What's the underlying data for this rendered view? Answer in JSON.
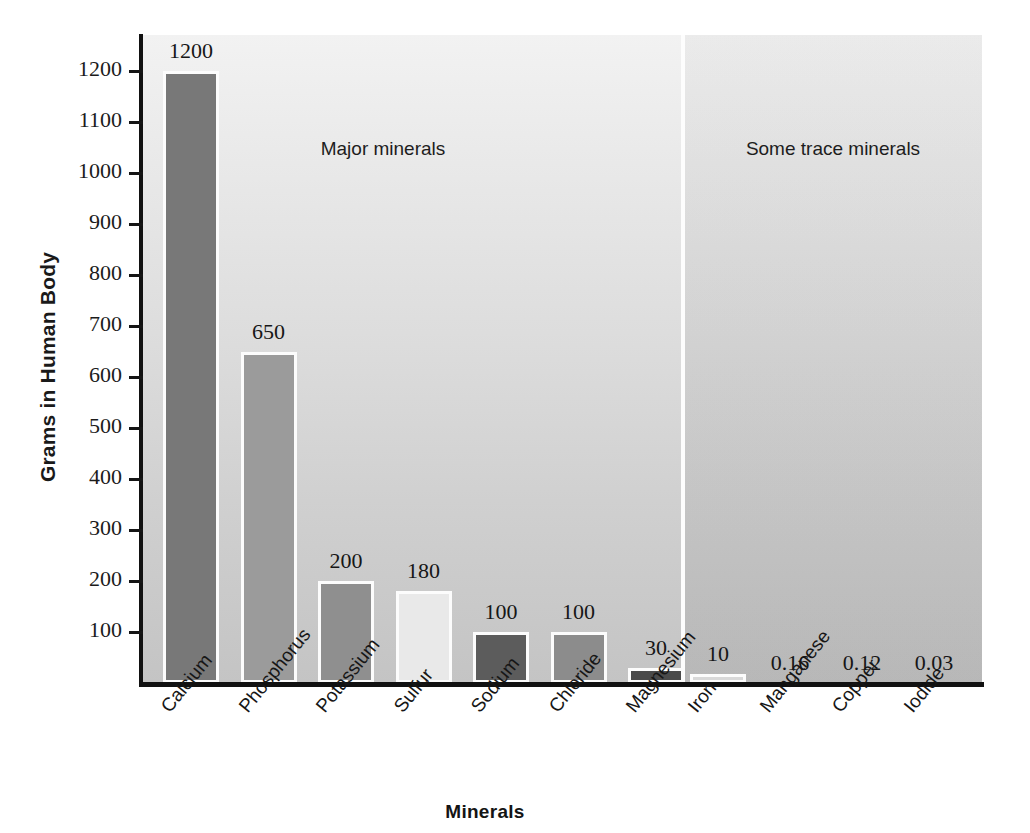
{
  "chart_data": {
    "type": "bar",
    "title": "",
    "xlabel": "Minerals",
    "ylabel": "Grams in Human Body",
    "ylim": [
      0,
      1250
    ],
    "grid": false,
    "legend_position": "none",
    "ytick_labels": [
      "1200",
      "1100",
      "1000",
      "900",
      "800",
      "700",
      "600",
      "500",
      "400",
      "300",
      "200",
      "100"
    ],
    "ytick_values": [
      1200,
      1100,
      1000,
      900,
      800,
      700,
      600,
      500,
      400,
      300,
      200,
      100
    ],
    "categories": [
      "Calcium",
      "Phosphorus",
      "Potassium",
      "Sulfur",
      "Sodium",
      "Chloride",
      "Magnesium",
      "Iron",
      "Manganese",
      "Copper",
      "Iodide"
    ],
    "values": [
      1200,
      650,
      200,
      180,
      100,
      100,
      30,
      10,
      0.16,
      0.12,
      0.03
    ],
    "value_labels": [
      "1200",
      "650",
      "200",
      "180",
      "100",
      "100",
      "30",
      "10",
      "0.16",
      "0.12",
      "0.03"
    ],
    "bar_colors": [
      "#787878",
      "#9b9b9b",
      "#8f8f8f",
      "#e9e9e9",
      "#5c5c5c",
      "#8c8c8c",
      "#4a4a4a",
      "#d8d8d8",
      "#bdbdbd",
      "#bdbdbd",
      "#bdbdbd"
    ],
    "annotations": [
      {
        "text": "Major minerals",
        "group": "major"
      },
      {
        "text": "Some trace minerals",
        "group": "trace"
      }
    ],
    "groups": [
      {
        "name": "Major minerals",
        "categories": [
          "Calcium",
          "Phosphorus",
          "Potassium",
          "Sulfur",
          "Sodium",
          "Chloride",
          "Magnesium"
        ]
      },
      {
        "name": "Some trace minerals",
        "categories": [
          "Iron",
          "Manganese",
          "Copper",
          "Iodide"
        ]
      }
    ]
  }
}
